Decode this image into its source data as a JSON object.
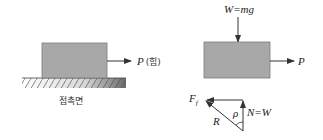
{
  "left_diagram": {
    "force_label": "P",
    "force_label_suffix": "(힘)",
    "surface_label": "접촉면"
  },
  "right_diagram": {
    "weight_label": "W=mg",
    "force_label": "P"
  },
  "force_triangle": {
    "friction_label": "F",
    "friction_subscript": "f",
    "resultant_label": "R",
    "angle_label": "ρ",
    "normal_label": "N=W"
  },
  "colors": {
    "block_fill": "#a8a8a8",
    "block_stroke": "#7a7a7a",
    "line": "#333333"
  }
}
